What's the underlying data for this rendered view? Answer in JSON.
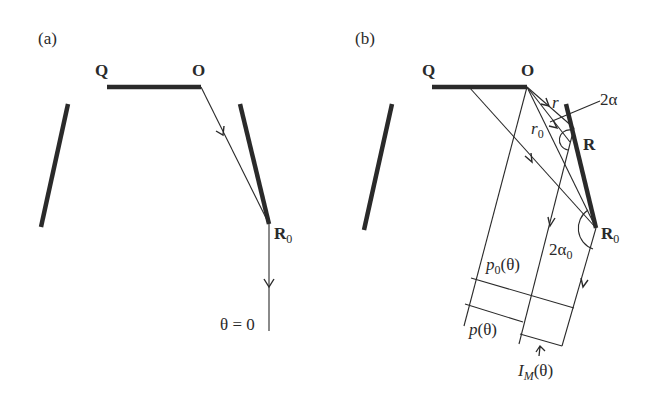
{
  "panel_a": {
    "label": "(a)",
    "Q": "Q",
    "O": "O",
    "R0_main": "R",
    "R0_sub": "0",
    "theta_label": "θ = 0"
  },
  "panel_b": {
    "label": "(b)",
    "Q": "Q",
    "O": "O",
    "R": "R",
    "R0_main": "R",
    "R0_sub": "0",
    "r": "r",
    "r0_main": "r",
    "r0_sub": "0",
    "two_alpha": "2α",
    "two_alpha0_main": "2α",
    "two_alpha0_sub": "0",
    "p0_main": "p",
    "p0_sub": "0",
    "p0_arg": "(θ)",
    "p_main": "p",
    "p_arg": "(θ)",
    "IM_main": "I",
    "IM_sub": "M",
    "IM_arg": "(θ)"
  },
  "colors": {
    "ink": "#2a2a2a",
    "background": "#ffffff"
  }
}
